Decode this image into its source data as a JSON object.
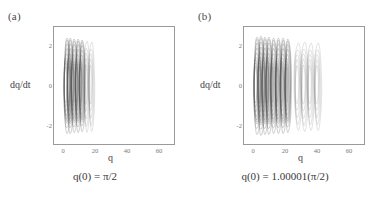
{
  "figure": {
    "background": "#ffffff",
    "frame_color": "#9a9a9a",
    "text_color": "#3a3a3a",
    "tick_color": "#7a7a7a"
  },
  "panels": [
    {
      "label": "(a)",
      "caption": "q(0) = π/2",
      "xlabel": "q",
      "ylabel": "dq/dt"
    },
    {
      "label": "(b)",
      "caption": "q(0) = 1.00001(π/2)",
      "xlabel": "q",
      "ylabel": "dq/dt"
    }
  ],
  "chart_data": [
    {
      "type": "line",
      "title": "(a)",
      "subtitle": "q(0) = π/2",
      "xlabel": "q",
      "ylabel": "dq/dt",
      "xlim": [
        -8,
        68
      ],
      "ylim": [
        -3.1,
        3.1
      ],
      "xticks": [
        0,
        20,
        40,
        60
      ],
      "yticks": [
        -2,
        0,
        2
      ],
      "grid": false,
      "legend": null,
      "description": "Phase-space trajectory of a chaotic driven pendulum: dense overlapping near-vertical loops confined to the left portion of the frame.",
      "trajectory_extent_q": [
        -3,
        18
      ],
      "trajectory_extent_dqdt": [
        -2.6,
        2.6
      ],
      "loop_count": 7,
      "loop_centers_q": [
        0.0,
        2.0,
        4.5,
        7.0,
        9.5,
        12.5,
        15.5
      ],
      "loop_amplitudes_dqdt": [
        2.5,
        2.5,
        2.45,
        2.45,
        2.4,
        2.4,
        2.35
      ],
      "loop_halfwidths_q": [
        2.2,
        2.1,
        2.1,
        2.0,
        2.0,
        1.9,
        1.9
      ],
      "stroke_color": "#555555",
      "stroke_width": 0.35
    },
    {
      "type": "line",
      "title": "(b)",
      "subtitle": "q(0) = 1.00001(π/2)",
      "xlabel": "q",
      "ylabel": "dq/dt",
      "xlim": [
        -8,
        68
      ],
      "ylim": [
        -3.1,
        3.1
      ],
      "xticks": [
        0,
        20,
        40,
        60
      ],
      "yticks": [
        -2,
        0,
        2
      ],
      "grid": false,
      "legend": null,
      "description": "Phase-space trajectory for a perturbed initial condition: loops drift further right, spanning roughly q = -3 to 42, dark dense loops on the left and lighter sparse loops on the right.",
      "trajectory_extent_q": [
        -3,
        42
      ],
      "trajectory_extent_dqdt": [
        -2.7,
        2.7
      ],
      "loop_count": 12,
      "loop_centers_q": [
        0.0,
        2.5,
        5.0,
        7.5,
        10.5,
        13.5,
        16.5,
        19.5,
        26.0,
        30.0,
        34.0,
        38.5
      ],
      "loop_amplitudes_dqdt": [
        2.55,
        2.6,
        2.55,
        2.55,
        2.5,
        2.5,
        2.5,
        2.45,
        2.3,
        2.35,
        2.3,
        2.3
      ],
      "loop_halfwidths_q": [
        2.3,
        2.3,
        2.2,
        2.2,
        2.2,
        2.1,
        2.1,
        2.1,
        2.4,
        2.4,
        2.3,
        2.3
      ],
      "stroke_color": "#555555",
      "stroke_width": 0.35
    }
  ],
  "ticks": {
    "x": [
      "0",
      "20",
      "40",
      "60"
    ],
    "y": [
      "2",
      "0",
      "-2"
    ]
  }
}
